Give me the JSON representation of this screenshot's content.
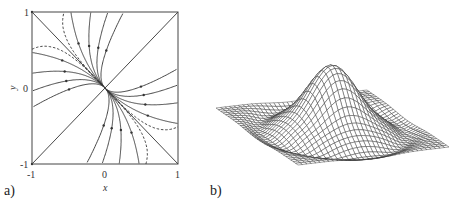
{
  "panel_a": {
    "label": "a)",
    "xlabel": "x",
    "ylabel": "y",
    "x_ticks": [
      "-1",
      "0",
      "1"
    ],
    "y_ticks": [
      "1",
      "0",
      "-1"
    ]
  },
  "panel_b": {
    "label": "b)"
  },
  "chart_data": [
    {
      "type": "line",
      "title": "a) Phase portrait (stable node at origin)",
      "xlabel": "x",
      "ylabel": "y",
      "xlim": [
        -1,
        1
      ],
      "ylim": [
        -1,
        1
      ],
      "x_ticks": [
        -1,
        0,
        1
      ],
      "y_ticks": [
        -1,
        0,
        1
      ],
      "grid": false,
      "eigen_lines": [
        {
          "name": "y = -x",
          "points": [
            [
              -1,
              1
            ],
            [
              1,
              -1
            ]
          ]
        },
        {
          "name": "y = x",
          "points": [
            [
              -1,
              -1
            ],
            [
              1,
              1
            ]
          ]
        }
      ],
      "trajectory_family": {
        "description": "curves u = C*w^2 with u=(x+y)/sqrt2, w=(x-y)/sqrt2",
        "C_values": [
          -3.2,
          -1.6,
          -0.8,
          -0.35,
          0.35,
          0.8,
          1.6,
          3.2
        ]
      },
      "dashed_curves": [
        {
          "name": "nullcline-1",
          "formula": "y = -x + 0.49 x^3",
          "endpoints": [
            [
              -1,
              0.51
            ],
            [
              1,
              -0.51
            ]
          ]
        },
        {
          "name": "nullcline-2",
          "formula": "x = -y + 0.44 y^3",
          "endpoints": [
            [
              -0.56,
              1
            ],
            [
              0.56,
              -1
            ]
          ]
        }
      ]
    },
    {
      "type": "surface",
      "title": "b) 3D wireframe surface with central peak",
      "function": "z = exp(-r^2/s^2) - 0.12*exp(-(r-r0)^2/w^2)",
      "params": {
        "s": 0.42,
        "r0": 0.85,
        "w": 0.15,
        "grid_n": 34,
        "peak_height_px": 62
      },
      "corners_px": {
        "left": [
          216,
          108
        ],
        "front": [
          298,
          165
        ],
        "right": [
          449,
          147
        ],
        "back": [
          367,
          90
        ]
      }
    }
  ]
}
